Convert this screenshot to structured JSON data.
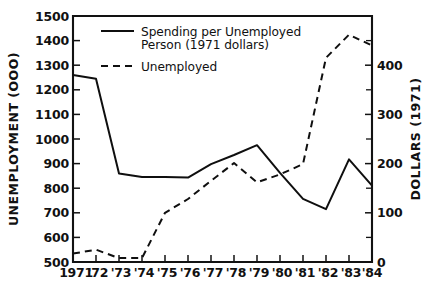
{
  "chart_data": {
    "type": "line",
    "title": "",
    "subtitle": "",
    "x": [
      "1971",
      "'72",
      "'73",
      "'74",
      "'75",
      "'76",
      "'77",
      "'78",
      "'79",
      "'80",
      "'81",
      "'82",
      "'83",
      "'84"
    ],
    "xlabel": "",
    "grid": false,
    "legend_position": "top-left",
    "axes": {
      "left": {
        "label": "UNEMPLOYMENT (OOO)",
        "ticks": [
          500,
          600,
          700,
          800,
          900,
          1000,
          1100,
          1200,
          1300,
          1400,
          1500
        ],
        "tick_labels": [
          "500",
          "600",
          "700",
          "800",
          "900",
          "1000",
          "1100",
          "1200",
          "1300",
          "1400",
          "1500"
        ],
        "lim": [
          500,
          1500
        ]
      },
      "right": {
        "label": "DOLLARS (1971)",
        "ticks": [
          0,
          100,
          200,
          300,
          400
        ],
        "tick_labels": [
          "0",
          "100",
          "200",
          "300",
          "400"
        ],
        "minor_ticks": [
          50,
          150,
          250,
          350,
          450
        ],
        "lim": [
          0,
          500
        ]
      }
    },
    "series": [
      {
        "name": "Spending per Unemployed Person (1971 dollars)",
        "style": "solid",
        "axis": "left",
        "values": [
          1260,
          1245,
          860,
          845,
          845,
          843,
          898,
          935,
          975,
          862,
          757,
          715,
          917,
          810
        ]
      },
      {
        "name": "Unemployed",
        "style": "dashed",
        "axis": "right",
        "values": [
          17,
          25,
          8,
          8,
          100,
          128,
          165,
          201,
          162,
          178,
          199,
          415,
          462,
          440
        ]
      }
    ]
  },
  "legend": {
    "entries": [
      {
        "label_line1": "Spending per Unemployed",
        "label_line2": "Person (1971 dollars)",
        "style": "solid"
      },
      {
        "label_line1": "Unemployed",
        "label_line2": "",
        "style": "dashed"
      }
    ]
  },
  "colors": {
    "ink": "#0f0f0f",
    "background": "#ffffff"
  }
}
